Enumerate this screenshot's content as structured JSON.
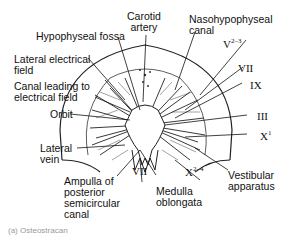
{
  "labels": {
    "carotid_artery": [
      "Carotid",
      "artery"
    ],
    "nasohypophyseal_canal": [
      "Nasohypophyseal",
      "canal"
    ],
    "hypophyseal_fossa": "Hypophyseal fossa",
    "lateral_electrical_field": [
      "Lateral electrical",
      "field"
    ],
    "canal_electrical_field": [
      "Canal leading to",
      "electrical field"
    ],
    "orbit": "Orbit",
    "lateral_vein": [
      "Lateral",
      "vein"
    ],
    "ampulla": [
      "Ampulla of",
      "posterior",
      "semicircular",
      "canal"
    ],
    "medulla": [
      "Medulla",
      "oblongata"
    ],
    "vestibular": [
      "Vestibular",
      "apparatus"
    ]
  },
  "nerves": {
    "v23": {
      "base": "V",
      "sup": "2–3"
    },
    "vii_right": {
      "base": "VII",
      "sup": ""
    },
    "ix": {
      "base": "IX",
      "sup": ""
    },
    "iii": {
      "base": "III",
      "sup": ""
    },
    "x1": {
      "base": "X",
      "sup": "1"
    },
    "x24": {
      "base": "X",
      "sup": "2–4"
    },
    "vii_bottom": {
      "base": "VII",
      "sup": ""
    }
  },
  "caption": "(a) Osteostracan"
}
